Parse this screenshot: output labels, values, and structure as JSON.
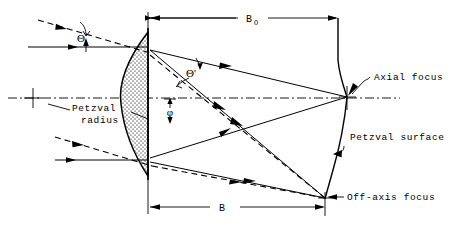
{
  "figure": {
    "kind": "optical-ray-diagram",
    "background_color": "#ffffff",
    "ink_color": "#000000",
    "lens_fill_color": "#cfcfcf"
  },
  "labels": {
    "theta": "Θ",
    "theta_prime": "Θ'",
    "phi": "φ",
    "b_o_main": "B",
    "b_o_sub": "O",
    "b_main": "B",
    "petzval_radius_line1": "Petzval",
    "petzval_radius_line2": "radius",
    "axial_focus": "Axial focus",
    "petzval_surface": "Petzval surface",
    "off_axis_focus": "Off-axis focus"
  },
  "geometry": {
    "optical_axis_y": 98,
    "lens_plane_x": 148,
    "lens_vertex_x": 121,
    "lens_top_y": 32,
    "lens_bottom_y": 176,
    "axial_focus_point": {
      "x": 347,
      "y": 97
    },
    "off_axis_focus_point": {
      "x": 325,
      "y": 198
    },
    "petzval_surface_top": {
      "x": 338,
      "y": 18
    },
    "dimension_b_o": {
      "x1": 148,
      "x2": 338,
      "y": 18
    },
    "dimension_b": {
      "x1": 148,
      "x2": 325,
      "y": 207
    }
  },
  "annotations": [
    {
      "name": "axial-focus",
      "text": "Axial focus",
      "points_to": "axial focus point on optical axis"
    },
    {
      "name": "petzval-surface",
      "text": "Petzval surface",
      "points_to": "curved image surface"
    },
    {
      "name": "off-axis-focus",
      "text": "Off-axis focus",
      "points_to": "lower focus point"
    },
    {
      "name": "petzval-radius",
      "text": "Petzval radius",
      "points_to": "radius construction line"
    }
  ]
}
